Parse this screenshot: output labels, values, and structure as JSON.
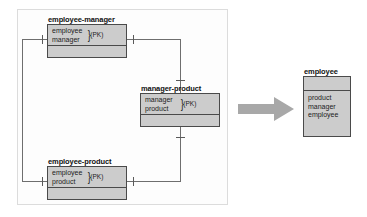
{
  "diagram": {
    "panel": {
      "name": "source-entities-group"
    },
    "colors": {
      "entity_fill": "#cccccc",
      "entity_border": "#4a4a4a",
      "line": "#6e6e6e",
      "arrow": "#a8a8a8",
      "panel_border": "#dcdcdc",
      "text": "#1c1c1c"
    },
    "source_entities": [
      {
        "id": "employee-manager",
        "title": "employee-manager",
        "attributes": [
          "employee",
          "manager"
        ],
        "key_annotation": "(PK)",
        "brace": "}"
      },
      {
        "id": "manager-product",
        "title": "manager-product",
        "attributes": [
          "manager",
          "product"
        ],
        "key_annotation": "(PK)",
        "brace": "}"
      },
      {
        "id": "employee-product",
        "title": "employee-product",
        "attributes": [
          "employee",
          "product"
        ],
        "key_annotation": "(PK)",
        "brace": "}"
      }
    ],
    "result_entity": {
      "id": "employee",
      "title": "employee",
      "attributes": [
        "product",
        "manager",
        "employee"
      ]
    },
    "arrow": {
      "name": "transform-arrow",
      "direction": "right"
    }
  }
}
